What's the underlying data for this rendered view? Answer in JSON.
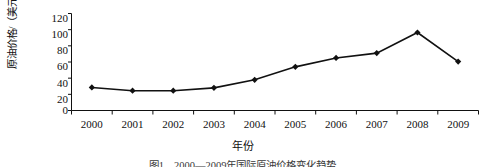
{
  "chart_data": {
    "type": "line",
    "title": "",
    "xlabel": "年份",
    "ylabel": "原油价格/（美元/桶）",
    "categories": [
      "2000",
      "2001",
      "2002",
      "2003",
      "2004",
      "2005",
      "2006",
      "2007",
      "2008",
      "2009"
    ],
    "values": [
      28.5,
      24.5,
      24.5,
      28,
      38,
      54,
      65,
      71,
      96.5,
      60.5
    ],
    "series": [
      {
        "name": "原油价格",
        "values": [
          28.5,
          24.5,
          24.5,
          28,
          38,
          54,
          65,
          71,
          96.5,
          60.5
        ]
      }
    ],
    "ylim": [
      0,
      120
    ],
    "yticks": [
      0,
      20,
      40,
      60,
      80,
      100,
      120
    ],
    "ytick_labels": [
      "0",
      "20",
      "40",
      "60",
      "80",
      "100",
      "120"
    ],
    "xtick_labels": [
      "2000",
      "2001",
      "2002",
      "2003",
      "2004",
      "2005",
      "2006",
      "2007",
      "2008",
      "2009"
    ],
    "grid": false,
    "legend": "none",
    "marker": "diamond",
    "line_color": "#111111",
    "marker_color": "#111111"
  },
  "figure": {
    "caption": "图1　2000—2009年国际原油价格变化趋势"
  }
}
